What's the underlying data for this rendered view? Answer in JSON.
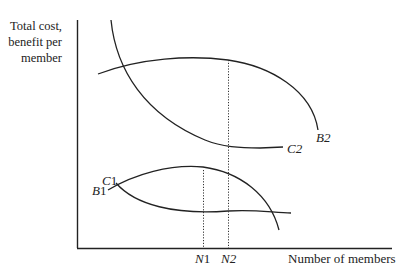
{
  "axes": {
    "y_label_lines": [
      "Total cost,",
      "benefit per",
      "member"
    ],
    "x_label": "Number of members"
  },
  "curves": {
    "C1": {
      "letter": "C",
      "digit": "1"
    },
    "B1": {
      "letter": "B",
      "digit": "1"
    },
    "C2": {
      "letter": "C",
      "digit": "2"
    },
    "B2": {
      "letter": "B",
      "digit": "2"
    }
  },
  "markers": {
    "N1": {
      "letter": "N",
      "digit": "1"
    },
    "N2": {
      "letter": "N",
      "digit": "2"
    }
  },
  "colors": {
    "line": "#222222",
    "background": "#ffffff"
  }
}
